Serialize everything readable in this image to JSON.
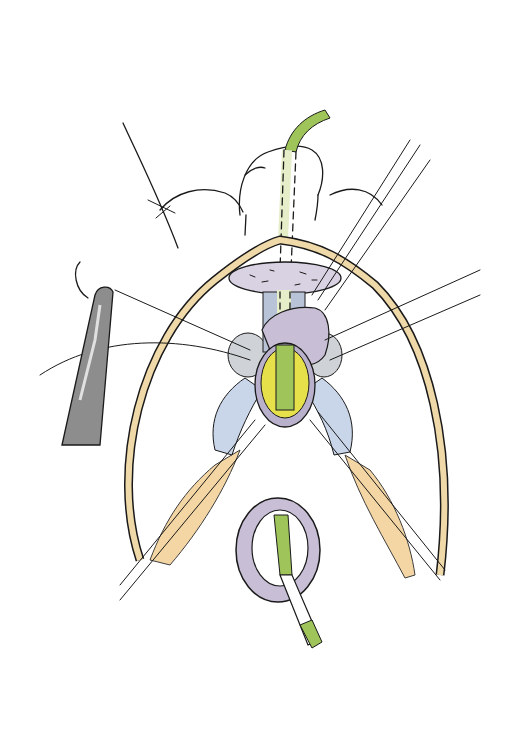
{
  "figure": {
    "kind": "surgical-illustration",
    "width": 532,
    "height": 748,
    "background": "#ffffff",
    "colors": {
      "catheter_green": "#9ec45a",
      "retractor_tan": "#f0d9a8",
      "tissue_purple": "#c8bfd6",
      "tissue_gray": "#cfd2d6",
      "tissue_blue": "#c9d6ea",
      "mucosa_yellow": "#e6e04a",
      "skin_orange": "#f3cf95",
      "instrument_gray": "#8d8d8d",
      "ink": "#1a1a1a"
    }
  }
}
